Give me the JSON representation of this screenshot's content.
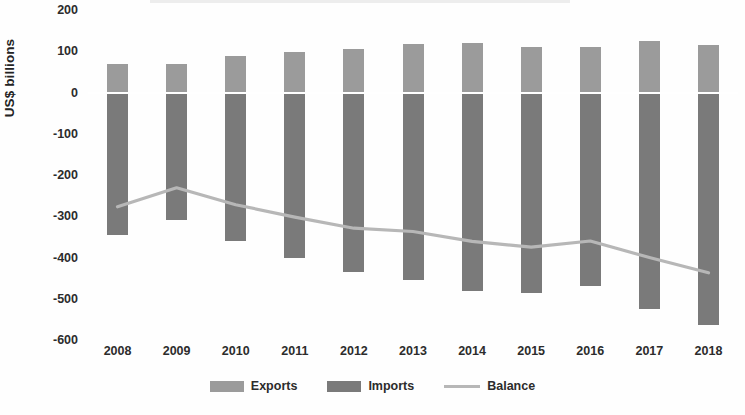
{
  "chart_data": {
    "type": "bar",
    "title": "",
    "subtitle": "",
    "xlabel": "",
    "ylabel": "US$ billions",
    "categories": [
      "2008",
      "2009",
      "2010",
      "2011",
      "2012",
      "2013",
      "2014",
      "2015",
      "2016",
      "2017",
      "2018"
    ],
    "ylim": [
      -600,
      200
    ],
    "yticks": [
      200,
      100,
      0,
      -100,
      -200,
      -300,
      -400,
      -500,
      -600
    ],
    "ytick_labels": [
      "200",
      "100",
      "0",
      "-100",
      "-200",
      "-300",
      "-400",
      "-500",
      "-600"
    ],
    "grid": false,
    "legend_position": "bottom",
    "series": [
      {
        "name": "Exports",
        "type": "bar",
        "color": "#9b9b9b",
        "values": [
          68,
          70,
          88,
          98,
          105,
          118,
          120,
          110,
          110,
          125,
          115
        ]
      },
      {
        "name": "Imports",
        "type": "bar",
        "color": "#7a7a7a",
        "values": [
          -345,
          -308,
          -360,
          -400,
          -434,
          -455,
          -481,
          -485,
          -470,
          -525,
          -564
        ]
      },
      {
        "name": "Balance",
        "type": "line",
        "color": "#b7b7b7",
        "values": [
          -277,
          -231,
          -272,
          -302,
          -329,
          -337,
          -361,
          -375,
          -360,
          -400,
          -437
        ]
      }
    ]
  },
  "legend": {
    "items": [
      {
        "label": "Exports",
        "marker": "bar-swatch-light"
      },
      {
        "label": "Imports",
        "marker": "bar-swatch-dark"
      },
      {
        "label": "Balance",
        "marker": "line-swatch"
      }
    ]
  },
  "axis": {
    "y_title": "US$ billions"
  }
}
